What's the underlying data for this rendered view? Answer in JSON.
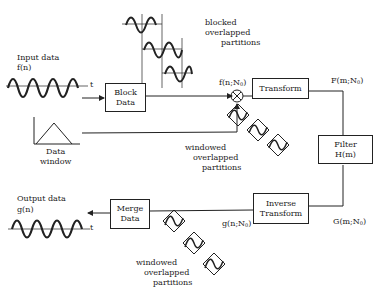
{
  "diagram": {
    "input": {
      "title": "Input data",
      "signal": "f(n)",
      "axis": "t"
    },
    "output": {
      "title": "Output data",
      "signal": "g(n)",
      "axis": "t"
    },
    "blocks": {
      "block_data": [
        "Block",
        "Data"
      ],
      "transform": [
        "Transform"
      ],
      "filter": [
        "Filter",
        "H(m)"
      ],
      "inverse_transform": [
        "Inverse",
        "Transform"
      ],
      "merge_data": [
        "Merge",
        "Data"
      ]
    },
    "data_window": [
      "Data",
      "window"
    ],
    "labels": {
      "f_n_N0": "f(n;N",
      "F_m_N0": "F(m;N",
      "G_m_N0": "G(m;N",
      "g_n_N0": "g(n;N",
      "sub0": "0",
      "close": ")"
    },
    "annotations": {
      "blocked": [
        "blocked",
        "overlapped",
        "partitions"
      ],
      "windowed_top": [
        "windowed",
        "overlapped",
        "partitions"
      ],
      "windowed_bottom": [
        "windowed",
        "overlapped",
        "partitions"
      ]
    }
  }
}
